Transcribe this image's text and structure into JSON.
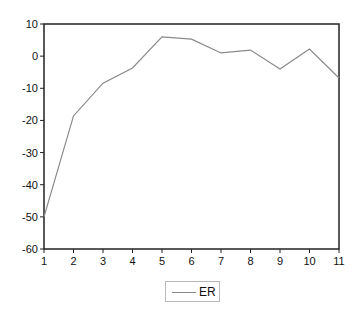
{
  "chart_data": {
    "type": "line",
    "title": "",
    "xlabel": "",
    "ylabel": "",
    "x": [
      1,
      2,
      3,
      4,
      5,
      6,
      7,
      8,
      9,
      10,
      11
    ],
    "series": [
      {
        "name": "ER",
        "color": "#8a8a8a",
        "values": [
          -50.0,
          -18.6,
          -8.4,
          -3.7,
          6.0,
          5.3,
          1.0,
          1.9,
          -4.0,
          2.2,
          -6.8
        ]
      }
    ],
    "xlim": [
      1,
      11
    ],
    "ylim": [
      -60,
      10
    ],
    "xticks": [
      "1",
      "2",
      "3",
      "4",
      "5",
      "6",
      "7",
      "8",
      "9",
      "10",
      "11"
    ],
    "yticks": [
      "10",
      "0",
      "-10",
      "-20",
      "-30",
      "-40",
      "-50",
      "-60"
    ],
    "grid": false,
    "legend_position": "bottom-center"
  },
  "legend": {
    "label": "ER"
  }
}
